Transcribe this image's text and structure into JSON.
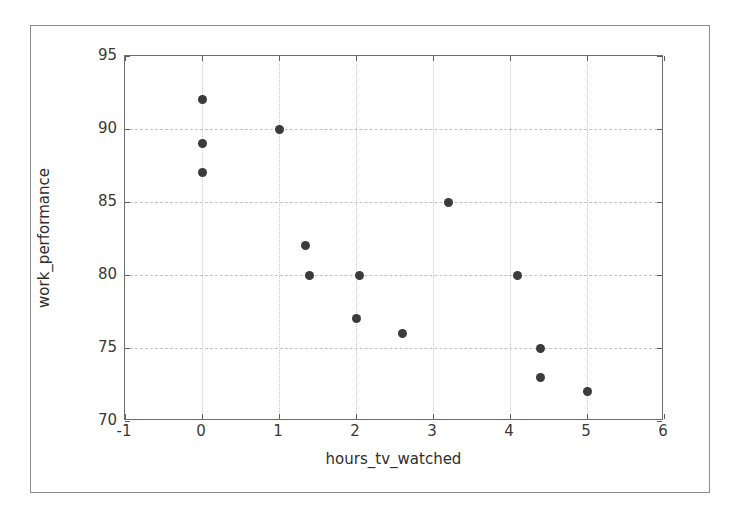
{
  "chart_data": {
    "type": "scatter",
    "title": "",
    "xlabel": "hours_tv_watched",
    "ylabel": "work_performance",
    "xlim": [
      -1,
      6
    ],
    "ylim": [
      70,
      95
    ],
    "xticks": [
      "-1",
      "0",
      "1",
      "2",
      "3",
      "4",
      "5",
      "6"
    ],
    "xtick_values": [
      -1,
      0,
      1,
      2,
      3,
      4,
      5,
      6
    ],
    "yticks": [
      "70",
      "75",
      "80",
      "85",
      "90",
      "95"
    ],
    "ytick_values": [
      70,
      75,
      80,
      85,
      90,
      95
    ],
    "grid": true,
    "grid_style": "dashed",
    "legend": null,
    "marker": "circle",
    "marker_color": "#3b3b3b",
    "marker_size": 9,
    "points": [
      {
        "x": 0,
        "y": 92
      },
      {
        "x": 0,
        "y": 89
      },
      {
        "x": 0,
        "y": 87
      },
      {
        "x": 1,
        "y": 90
      },
      {
        "x": 1.35,
        "y": 82
      },
      {
        "x": 1.4,
        "y": 80
      },
      {
        "x": 2.0,
        "y": 77
      },
      {
        "x": 2.05,
        "y": 80
      },
      {
        "x": 2.6,
        "y": 76
      },
      {
        "x": 3.2,
        "y": 85
      },
      {
        "x": 4.1,
        "y": 80
      },
      {
        "x": 4.4,
        "y": 75
      },
      {
        "x": 4.4,
        "y": 73
      },
      {
        "x": 5.0,
        "y": 72
      }
    ]
  }
}
